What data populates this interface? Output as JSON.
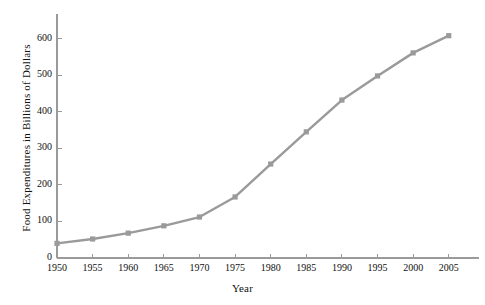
{
  "chart_data": {
    "type": "line",
    "title": "",
    "subtitle": "",
    "xlabel": "Year",
    "ylabel": "Food Expenditures in Billions of Dollars",
    "x": [
      1950,
      1955,
      1960,
      1965,
      1970,
      1975,
      1980,
      1985,
      1990,
      1995,
      2000,
      2005
    ],
    "categories": [
      "1950",
      "1955",
      "1960",
      "1965",
      "1970",
      "1975",
      "1980",
      "1985",
      "1990",
      "1995",
      "2000",
      "2005"
    ],
    "values": [
      40,
      52,
      68,
      88,
      112,
      167,
      257,
      345,
      432,
      498,
      561,
      608
    ],
    "series": [
      {
        "name": "Food Expenditures",
        "values": [
          40,
          52,
          68,
          88,
          112,
          167,
          257,
          345,
          432,
          498,
          561,
          608
        ]
      }
    ],
    "xlim": [
      1950,
      2007
    ],
    "ylim": [
      0,
      640
    ],
    "xticks": [
      1950,
      1955,
      1960,
      1965,
      1970,
      1975,
      1980,
      1985,
      1990,
      1995,
      2000,
      2005
    ],
    "xtick_labels": [
      "1950",
      "1955",
      "1960",
      "1965",
      "1970",
      "1975",
      "1980",
      "1985",
      "1990",
      "1995",
      "2000",
      "2005"
    ],
    "yticks": [
      0,
      100,
      200,
      300,
      400,
      500,
      600
    ],
    "ytick_labels": [
      "0",
      "100",
      "200",
      "300",
      "400",
      "500",
      "600"
    ],
    "grid": false,
    "legend": false,
    "legend_position": "none",
    "marker": "square",
    "line_color": "#9a9a9a",
    "marker_color": "#9a9a9a",
    "axis_color": "#9a9a9a",
    "text_color": "#111111",
    "background_color": "#ffffff"
  }
}
